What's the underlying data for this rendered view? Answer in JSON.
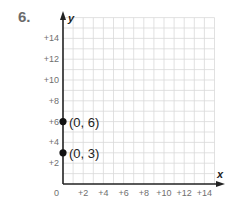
{
  "problem": {
    "number": "6."
  },
  "chart_data": {
    "type": "scatter",
    "title": "",
    "xlabel": "x",
    "ylabel": "y",
    "xlim": [
      0,
      15
    ],
    "ylim": [
      0,
      16
    ],
    "grid": true,
    "origin_label": "0",
    "x_ticks": [
      "+2",
      "+4",
      "+6",
      "+8",
      "+10",
      "+12",
      "+14"
    ],
    "y_ticks": [
      "+2",
      "+4",
      "+6",
      "+8",
      "+10",
      "+12",
      "+14"
    ],
    "points": [
      {
        "x": 0,
        "y": 6,
        "label": "(0, 6)"
      },
      {
        "x": 0,
        "y": 3,
        "label": "(0, 3)"
      }
    ],
    "colors": {
      "grid": "#d9d9d9",
      "axis": "#222222",
      "point": "#111111"
    }
  }
}
